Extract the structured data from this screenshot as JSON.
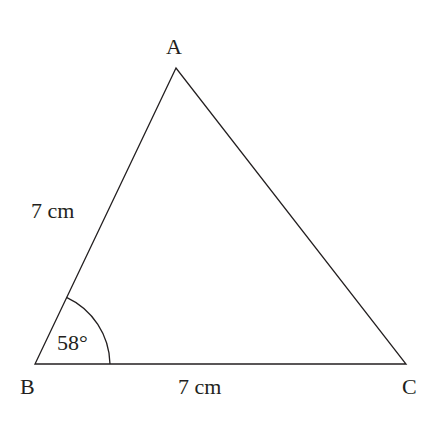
{
  "diagram": {
    "type": "triangle",
    "vertices": {
      "A": {
        "label": "A"
      },
      "B": {
        "label": "B"
      },
      "C": {
        "label": "C"
      }
    },
    "sides": {
      "AB": {
        "label": "7 cm"
      },
      "BC": {
        "label": "7 cm"
      }
    },
    "angles": {
      "B": {
        "label": "58°"
      }
    },
    "line_color": "#231f20"
  }
}
